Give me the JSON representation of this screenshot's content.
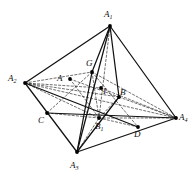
{
  "figure": {
    "kind": "geometry-diagram",
    "shape": "tetrahedron",
    "stroke_color": "#111111",
    "dash_color": "#222222",
    "vertex_dot_color": "#000000",
    "background": "#ffffff",
    "width": 195,
    "height": 177
  },
  "labels": {
    "a1": "A",
    "a1_sub": "1",
    "a2": "A",
    "a2_sub": "2",
    "a3": "A",
    "a3_sub": "3",
    "a4": "A",
    "a4_sub": "4",
    "b1": "B",
    "b1_sub": "1",
    "a": "A",
    "b": "B",
    "c": "C",
    "d": "D",
    "g": "G",
    "i": "I"
  },
  "points": {
    "A1": {
      "x": 110,
      "y": 26,
      "label": "A1"
    },
    "A2": {
      "x": 25,
      "y": 83,
      "label": "A2"
    },
    "A3": {
      "x": 77,
      "y": 152,
      "label": "A3"
    },
    "A4": {
      "x": 176,
      "y": 118,
      "label": "A4"
    },
    "B1": {
      "x": 99,
      "y": 118,
      "label": "B1"
    },
    "A": {
      "x": 70,
      "y": 79,
      "label": "A"
    },
    "B": {
      "x": 119,
      "y": 97,
      "label": "B"
    },
    "C": {
      "x": 47,
      "y": 113,
      "label": "C"
    },
    "D": {
      "x": 138,
      "y": 127,
      "label": "D"
    },
    "G": {
      "x": 92,
      "y": 72,
      "label": "G"
    },
    "I": {
      "x": 101,
      "y": 88,
      "label": "I"
    }
  },
  "edges_solid": [
    [
      "A1",
      "A2"
    ],
    [
      "A1",
      "A3"
    ],
    [
      "A1",
      "A4"
    ],
    [
      "A2",
      "A3"
    ],
    [
      "A3",
      "A4"
    ],
    [
      "A1",
      "G"
    ],
    [
      "G",
      "A3"
    ],
    [
      "A1",
      "B"
    ],
    [
      "B",
      "A3"
    ],
    [
      "A2",
      "D"
    ],
    [
      "C",
      "A4"
    ]
  ],
  "edges_dashed": [
    [
      "A2",
      "A4"
    ],
    [
      "A2",
      "G"
    ],
    [
      "A2",
      "B"
    ],
    [
      "A2",
      "B1"
    ],
    [
      "A2",
      "I"
    ],
    [
      "G",
      "A4"
    ],
    [
      "B1",
      "A4"
    ],
    [
      "I",
      "A4"
    ],
    [
      "B",
      "A4"
    ],
    [
      "A1",
      "B1"
    ],
    [
      "A3",
      "B1"
    ],
    [
      "G",
      "B1"
    ],
    [
      "B",
      "B1"
    ],
    [
      "A",
      "B1"
    ],
    [
      "C",
      "B1"
    ],
    [
      "B1",
      "D"
    ],
    [
      "A",
      "B"
    ],
    [
      "G",
      "C"
    ],
    [
      "G",
      "D"
    ]
  ],
  "label_positions": {
    "A1": {
      "x": 104,
      "y": 10
    },
    "A2": {
      "x": 8,
      "y": 74
    },
    "A3": {
      "x": 70,
      "y": 161
    },
    "A4": {
      "x": 179,
      "y": 113
    },
    "B1": {
      "x": 95,
      "y": 122
    },
    "A": {
      "x": 57,
      "y": 74
    },
    "B": {
      "x": 120,
      "y": 88
    },
    "C": {
      "x": 38,
      "y": 116
    },
    "D": {
      "x": 134,
      "y": 130
    },
    "G": {
      "x": 86,
      "y": 59
    },
    "I": {
      "x": 103,
      "y": 87
    }
  }
}
